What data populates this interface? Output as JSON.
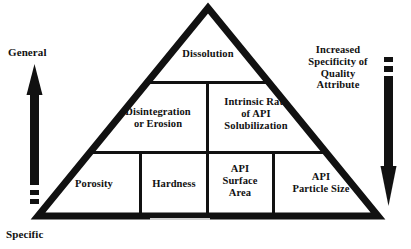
{
  "diagram": {
    "background_color": "#ffffff",
    "stroke_color": "#111111"
  },
  "pyramid": {
    "tiers": [
      {
        "name": "top",
        "cells": [
          {
            "id": "dissolution",
            "label": "Dissolution"
          }
        ]
      },
      {
        "name": "middle",
        "cells": [
          {
            "id": "disintegration",
            "label": "Disintegration\nor Erosion"
          },
          {
            "id": "intrinsic",
            "label": "Intrinsic Rate\nof API\nSolubilization"
          }
        ]
      },
      {
        "name": "bottom",
        "cells": [
          {
            "id": "porosity",
            "label": "Porosity"
          },
          {
            "id": "hardness",
            "label": "Hardness"
          },
          {
            "id": "surface_area",
            "label": "API\nSurface\nArea"
          },
          {
            "id": "particle_size",
            "label": "API\nParticle Size"
          }
        ]
      }
    ]
  },
  "left_axis": {
    "top_label": "General",
    "bottom_label": "Specific",
    "arrow_direction": "up"
  },
  "right_axis": {
    "label": "Increased\nSpecificity of\nQuality\nAttribute",
    "arrow_direction": "down"
  }
}
